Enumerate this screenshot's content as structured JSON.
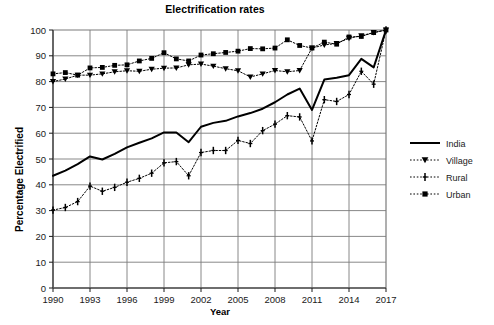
{
  "chart_data": {
    "type": "line",
    "title": "Electrification rates",
    "xlabel": "Year",
    "ylabel": "Percentage Electrified",
    "xlim": [
      1990,
      2017
    ],
    "ylim": [
      0,
      100
    ],
    "yticks": [
      0,
      10,
      20,
      30,
      40,
      50,
      60,
      70,
      80,
      90,
      100
    ],
    "xticks": [
      1990,
      1993,
      1996,
      1999,
      2002,
      2005,
      2008,
      2011,
      2014,
      2017
    ],
    "grid": true,
    "legend_position": "right",
    "x": [
      1990,
      1991,
      1992,
      1993,
      1994,
      1995,
      1996,
      1997,
      1998,
      1999,
      2000,
      2001,
      2002,
      2003,
      2004,
      2005,
      2006,
      2007,
      2008,
      2009,
      2010,
      2011,
      2012,
      2013,
      2014,
      2015,
      2016,
      2017
    ],
    "series": [
      {
        "name": "India",
        "marker": "none",
        "linestyle": "solid",
        "color": "#000000",
        "values": [
          43.5,
          45.5,
          48.0,
          51.0,
          49.8,
          52.0,
          54.5,
          56.3,
          58.0,
          60.3,
          60.3,
          56.5,
          62.5,
          64.0,
          64.8,
          66.5,
          67.8,
          69.5,
          72.0,
          75.0,
          77.3,
          69.0,
          80.8,
          81.5,
          82.5,
          88.8,
          85.5,
          100.0
        ]
      },
      {
        "name": "Village",
        "marker": "triangle-down",
        "linestyle": "dotted",
        "color": "#000000",
        "values": [
          80.0,
          81.0,
          82.5,
          82.5,
          83.0,
          83.8,
          84.2,
          84.0,
          84.8,
          85.2,
          85.3,
          86.5,
          86.8,
          86.0,
          85.0,
          84.2,
          81.8,
          83.0,
          84.3,
          83.8,
          84.3,
          93.0,
          94.2,
          94.8,
          96.8,
          97.8,
          99.0,
          100.0
        ]
      },
      {
        "name": "Rural",
        "marker": "plus",
        "linestyle": "dotted",
        "color": "#000000",
        "values": [
          30.2,
          31.2,
          33.5,
          39.5,
          37.5,
          39.0,
          41.0,
          42.5,
          44.5,
          48.5,
          49.0,
          43.5,
          52.5,
          53.3,
          53.3,
          57.2,
          56.0,
          61.0,
          63.5,
          66.8,
          66.3,
          57.0,
          73.0,
          72.3,
          75.0,
          84.0,
          79.0,
          100.0
        ]
      },
      {
        "name": "Urban",
        "marker": "square",
        "linestyle": "dotted",
        "color": "#000000",
        "values": [
          83.0,
          83.5,
          82.5,
          85.3,
          85.5,
          86.3,
          86.5,
          88.0,
          89.0,
          91.2,
          88.8,
          88.0,
          90.3,
          90.8,
          91.3,
          91.8,
          92.8,
          92.7,
          93.0,
          96.2,
          94.0,
          93.0,
          95.3,
          94.5,
          97.3,
          97.5,
          99.0,
          100.0
        ]
      }
    ]
  },
  "legend": {
    "items": [
      {
        "label": "India"
      },
      {
        "label": "Village"
      },
      {
        "label": "Rural"
      },
      {
        "label": "Urban"
      }
    ]
  }
}
